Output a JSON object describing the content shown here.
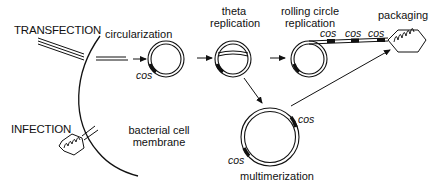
{
  "diagram": {
    "entry_routes": {
      "transfection": "TRANSFECTION",
      "infection": "INFECTION"
    },
    "membrane_label_line1": "bacterial cell",
    "membrane_label_line2": "membrane",
    "steps": {
      "circularization": "circularization",
      "theta_line1": "theta",
      "theta_line2": "replication",
      "rolling_line1": "rolling circle",
      "rolling_line2": "replication",
      "packaging": "packaging",
      "multimerization": "multimerization"
    },
    "cos_site_label": "cos",
    "colors": {
      "stroke": "#111111",
      "background": "#ffffff"
    }
  }
}
